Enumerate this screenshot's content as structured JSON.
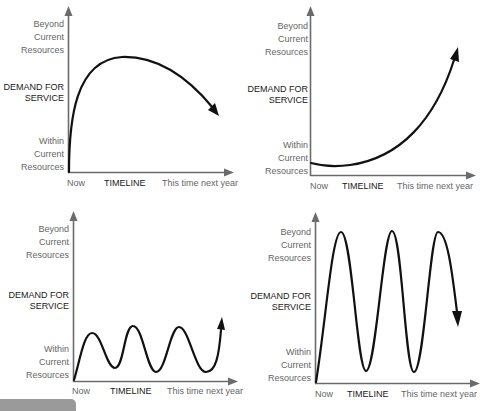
{
  "figure": {
    "panels": [
      {
        "id": "top-left",
        "pattern": "rise-then-decline",
        "y_top_label": [
          "Beyond",
          "Current",
          "Resources"
        ],
        "y_axis_title": [
          "DEMAND FOR",
          "SERVICE"
        ],
        "y_bottom_label": [
          "Within",
          "Current",
          "Resources"
        ],
        "x_start_label": "Now",
        "x_axis_title": "TIMELINE",
        "x_end_label": "This time next year"
      },
      {
        "id": "top-right",
        "pattern": "slow-start-exponential-growth",
        "y_top_label": [
          "Beyond",
          "Current",
          "Resources"
        ],
        "y_axis_title": [
          "DEMAND FOR",
          "SERVICE"
        ],
        "y_bottom_label": [
          "Within",
          "Current",
          "Resources"
        ],
        "x_start_label": "Now",
        "x_axis_title": "TIMELINE",
        "x_end_label": "This time next year"
      },
      {
        "id": "bottom-left",
        "pattern": "small-oscillation-within-resources",
        "y_top_label": [
          "Beyond",
          "Current",
          "Resources"
        ],
        "y_axis_title": [
          "DEMAND FOR",
          "SERVICE"
        ],
        "y_bottom_label": [
          "Within",
          "Current",
          "Resources"
        ],
        "x_start_label": "Now",
        "x_axis_title": "TIMELINE",
        "x_end_label": "This time next year"
      },
      {
        "id": "bottom-right",
        "pattern": "large-oscillation-spanning-full-range",
        "y_top_label": [
          "Beyond",
          "Current",
          "Resources"
        ],
        "y_axis_title": [
          "DEMAND FOR",
          "SERVICE"
        ],
        "y_bottom_label": [
          "Within",
          "Current",
          "Resources"
        ],
        "x_start_label": "Now",
        "x_axis_title": "TIMELINE",
        "x_end_label": "This time next year"
      }
    ],
    "colors": {
      "axis": "#6b6b6b",
      "curve": "#111111",
      "label_muted": "#666666",
      "label_strong": "#1a1a1a",
      "corner_bar": "#9a9a9a"
    }
  }
}
